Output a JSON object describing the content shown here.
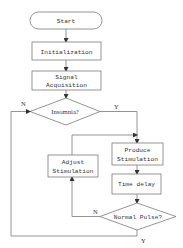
{
  "flowchart": {
    "nodes": {
      "start": {
        "label": "Start",
        "shape": "terminator"
      },
      "init": {
        "label": "Initialization",
        "shape": "process"
      },
      "signal": {
        "line1": "Signal",
        "line2": "Acquisition",
        "shape": "process"
      },
      "insomnia": {
        "label": "Insomnia?",
        "shape": "decision"
      },
      "produce": {
        "line1": "Produce",
        "line2": "Stimulation",
        "shape": "process"
      },
      "delay": {
        "label": "Time delay",
        "shape": "process"
      },
      "pulse": {
        "label": "Normal Pulse?",
        "shape": "decision"
      },
      "adjust": {
        "line1": "Adjust",
        "line2": "Stimulation",
        "shape": "process"
      }
    },
    "edge_labels": {
      "insomnia_no": "N",
      "insomnia_yes": "Y",
      "pulse_no": "N",
      "pulse_yes": "Y"
    },
    "colors": {
      "stroke": "#7a7a7a",
      "arrow": "#333333",
      "text": "#333333"
    }
  }
}
